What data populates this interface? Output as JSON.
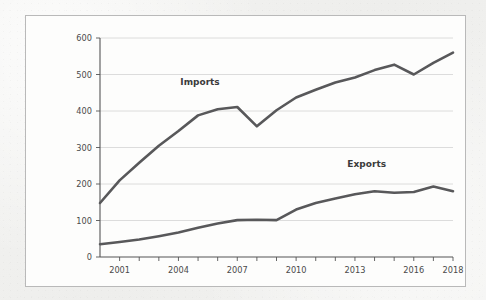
{
  "chart_data": {
    "type": "line",
    "title": "",
    "xlabel": "",
    "ylabel": "",
    "xlim": [
      2000,
      2018
    ],
    "ylim": [
      0,
      600
    ],
    "grid": true,
    "legend_position": "inline-annotation",
    "yticks": [
      0,
      100,
      200,
      300,
      400,
      500,
      600
    ],
    "ytick_labels": [
      "0",
      "100",
      "200",
      "300",
      "400",
      "500",
      "600"
    ],
    "xticks": [
      2001,
      2004,
      2007,
      2010,
      2013,
      2016,
      2018
    ],
    "xtick_labels": [
      "2001",
      "2004",
      "2007",
      "2010",
      "2013",
      "2016",
      "2018"
    ],
    "x": [
      2000,
      2001,
      2002,
      2003,
      2004,
      2005,
      2006,
      2007,
      2008,
      2009,
      2010,
      2011,
      2012,
      2013,
      2014,
      2015,
      2016,
      2017,
      2018
    ],
    "series": [
      {
        "name": "Imports",
        "color": "#58585a",
        "values": [
          148,
          210,
          258,
          305,
          345,
          388,
          405,
          411,
          358,
          402,
          437,
          458,
          478,
          492,
          512,
          527,
          500,
          532,
          560
        ]
      },
      {
        "name": "Exports",
        "color": "#58585a",
        "values": [
          35,
          41,
          48,
          57,
          67,
          80,
          92,
          101,
          102,
          101,
          130,
          148,
          160,
          172,
          180,
          176,
          178,
          193,
          180
        ]
      }
    ],
    "annotations": [
      {
        "text": "Imports",
        "x": 2005.1,
        "y": 470
      },
      {
        "text": "Exports",
        "x": 2013.6,
        "y": 247
      }
    ]
  },
  "colors": {
    "line": "#58585a",
    "grid": "#d8d8d8",
    "axis": "#555555",
    "plot_background": "#fdfdfc",
    "page_background": "#f2f2f0",
    "frame_border": "#b9b9b9",
    "tick_text": "#4a4a4a"
  }
}
